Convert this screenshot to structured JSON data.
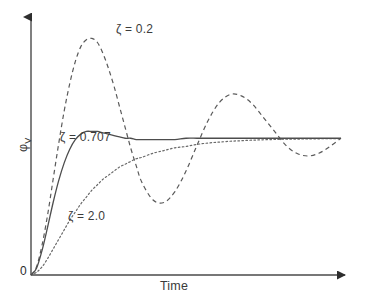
{
  "figure": {
    "background_color": "#ffffff",
    "axis_color": "#4a4a4a",
    "curve_color": "#4d4d4d",
    "text_color": "#3b3b3b"
  },
  "axes": {
    "x_label": "Time",
    "y_label_symbol": "φ",
    "y_label_subscript": "V",
    "origin_label": "0",
    "x_arrow": "arrow-right",
    "y_arrow": "arrow-up"
  },
  "annotations": {
    "zeta_02": "ζ = 0.2",
    "zeta_0707": "ζ = 0.707",
    "zeta_20": "ζ = 2.0"
  },
  "chart_data": {
    "type": "line",
    "title": "",
    "xlabel": "Time",
    "ylabel": "φ_V",
    "grid": false,
    "legend": "inline-annotations",
    "xlim": [
      0,
      14
    ],
    "ylim": [
      0,
      1.85
    ],
    "steady_state": 1.0,
    "x": [
      0,
      0.25,
      0.5,
      0.75,
      1,
      1.25,
      1.5,
      1.75,
      2,
      2.25,
      2.5,
      2.75,
      3,
      3.25,
      3.5,
      3.75,
      4,
      4.25,
      4.5,
      4.75,
      5,
      5.5,
      6,
      6.5,
      7,
      7.5,
      8,
      8.5,
      9,
      9.5,
      10,
      10.5,
      11,
      11.5,
      12,
      12.5,
      13,
      13.5,
      14
    ],
    "series": [
      {
        "name": "ζ = 0.2",
        "zeta": 0.2,
        "style": "dashed",
        "color": "#5a5a5a",
        "peak_value": 1.73,
        "peak_time": 2.2,
        "trough_value": 0.53,
        "trough_time": 4.6,
        "second_peak_value": 1.32,
        "second_peak_time": 7.0,
        "values": [
          0,
          0.06,
          0.22,
          0.44,
          0.7,
          0.96,
          1.2,
          1.4,
          1.56,
          1.67,
          1.72,
          1.73,
          1.7,
          1.62,
          1.51,
          1.38,
          1.23,
          1.08,
          0.93,
          0.8,
          0.68,
          0.55,
          0.53,
          0.61,
          0.76,
          0.95,
          1.13,
          1.26,
          1.32,
          1.31,
          1.25,
          1.15,
          1.05,
          0.95,
          0.89,
          0.87,
          0.89,
          0.94,
          1.0
        ]
      },
      {
        "name": "ζ = 0.707",
        "zeta": 0.707,
        "style": "solid",
        "color": "#4d4d4d",
        "peak_value": 1.05,
        "peak_time": 2.4,
        "values": [
          0,
          0.05,
          0.18,
          0.35,
          0.53,
          0.69,
          0.82,
          0.92,
          0.99,
          1.03,
          1.05,
          1.05,
          1.05,
          1.04,
          1.03,
          1.02,
          1.01,
          1.0,
          1.0,
          0.99,
          0.99,
          0.99,
          0.99,
          0.99,
          1.0,
          1.0,
          1.0,
          1.0,
          1.0,
          1.0,
          1.0,
          1.0,
          1.0,
          1.0,
          1.0,
          1.0,
          1.0,
          1.0,
          1.0
        ]
      },
      {
        "name": "ζ = 2.0",
        "zeta": 2.0,
        "style": "dotted",
        "color": "#6a6a6a",
        "peak_value": 1.0,
        "values": [
          0,
          0.02,
          0.06,
          0.12,
          0.19,
          0.26,
          0.33,
          0.4,
          0.46,
          0.52,
          0.57,
          0.62,
          0.66,
          0.7,
          0.73,
          0.76,
          0.79,
          0.81,
          0.83,
          0.85,
          0.86,
          0.89,
          0.91,
          0.93,
          0.94,
          0.955,
          0.965,
          0.972,
          0.978,
          0.982,
          0.986,
          0.989,
          0.991,
          0.993,
          0.994,
          0.995,
          0.996,
          0.9965,
          0.997
        ]
      }
    ]
  }
}
